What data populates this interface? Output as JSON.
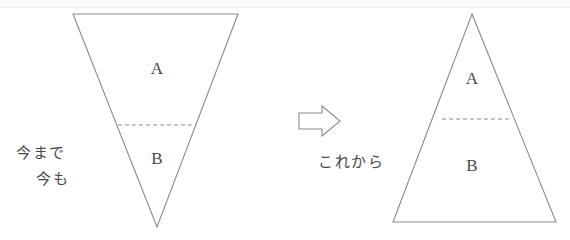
{
  "figure": {
    "stroke_color": "#8b8b91",
    "background_color": "#ffffff",
    "label_color": "#46464c"
  },
  "left_panel": {
    "name": "current-state-diagram",
    "shape": "inverted-triangle",
    "caption_line1": "今まで",
    "caption_line2": "今も",
    "segment_top_label": "A",
    "segment_bottom_label": "B",
    "geometry": {
      "top_left_x": 73,
      "top_right_x": 238,
      "top_y": 14,
      "apex_x": 157,
      "apex_y": 227,
      "divider_y": 125,
      "divider_x1": 118,
      "divider_x2": 196
    }
  },
  "transition": {
    "name": "rightward-arrow",
    "glyph": "⇒",
    "direction": "right"
  },
  "right_panel": {
    "name": "future-state-diagram",
    "shape": "upright-triangle",
    "caption_line1": "これから",
    "segment_top_label": "A",
    "segment_bottom_label": "B",
    "geometry": {
      "apex_x": 472,
      "apex_y": 14,
      "base_left_x": 393,
      "base_right_x": 556,
      "base_y": 222,
      "divider_y": 119,
      "divider_x1": 442,
      "divider_x2": 512
    }
  }
}
